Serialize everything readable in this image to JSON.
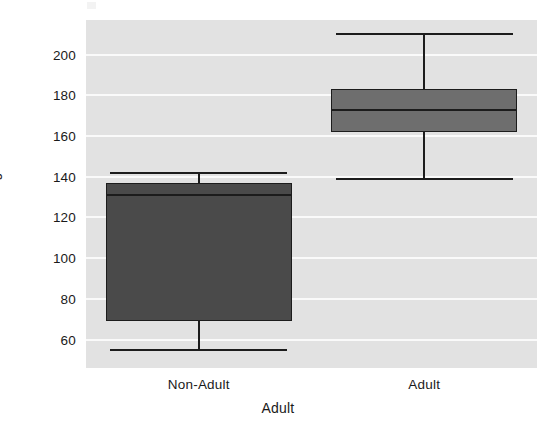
{
  "chart_data": {
    "type": "box",
    "title": "",
    "xlabel": "Adult",
    "ylabel": "Height",
    "categories": [
      "Non-Adult",
      "Adult"
    ],
    "ylim": [
      46,
      217
    ],
    "yticks": [
      60,
      80,
      100,
      120,
      140,
      160,
      180,
      200
    ],
    "ytick_labels": [
      "60",
      "80",
      "100",
      "120",
      "140",
      "160",
      "180",
      "200"
    ],
    "grid": true,
    "grid_color": "#fafafa",
    "panel_color": "#e2e2e2",
    "legend": "none",
    "boxes": [
      {
        "category": "Non-Adult",
        "whisker_low": 55,
        "q1": 69,
        "median": 131,
        "q3": 137,
        "whisker_high": 142,
        "fill_color": "#4a4a4a",
        "line_color": "#1c1c1c"
      },
      {
        "category": "Adult",
        "whisker_low": 139,
        "q1": 162,
        "median": 173,
        "q3": 183,
        "whisker_high": 210,
        "fill_color": "#6e6e6e",
        "line_color": "#1c1c1c"
      }
    ]
  },
  "axis": {
    "y_title": "Height",
    "x_title": "Adult",
    "y_tick_labels": [
      "200",
      "180",
      "160",
      "140",
      "120",
      "100",
      "80",
      "60"
    ],
    "x_tick_labels": [
      "Non-Adult",
      "Adult"
    ]
  }
}
